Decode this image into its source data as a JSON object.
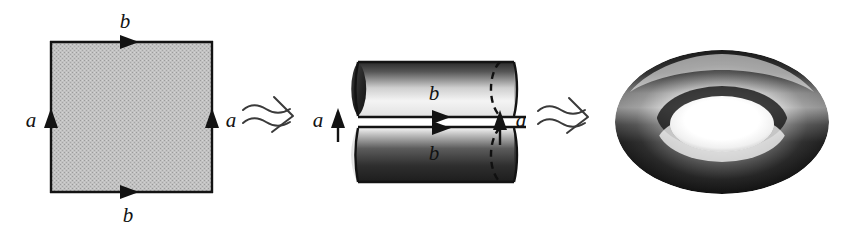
{
  "figure": {
    "background_color": "#ffffff",
    "ink_color": "#131313",
    "square_fill_color": "#b8b8b8",
    "stages": [
      {
        "id": "square",
        "name": "square",
        "caption": "Square with identified edges",
        "edge_labels": {
          "top": "b",
          "bottom": "b",
          "left": "a",
          "right": "a"
        },
        "edge_directions": {
          "top": "right",
          "bottom": "right",
          "left": "up",
          "right": "up"
        }
      },
      {
        "id": "cylinder",
        "name": "cylinder",
        "caption": "Cylinder formed by gluing the a edges",
        "edge_labels": {
          "top": "b",
          "bottom": "b",
          "seam": "a"
        },
        "edge_directions": {
          "top": "right",
          "bottom": "right",
          "seam": "up"
        }
      },
      {
        "id": "torus",
        "name": "torus",
        "caption": "Torus formed by gluing the b edges",
        "edge_labels": {},
        "edge_directions": {}
      }
    ],
    "transitions": [
      {
        "id": "arrow-1",
        "symbol": "squiggly-arrow",
        "from": "square",
        "to": "cylinder"
      },
      {
        "id": "arrow-2",
        "symbol": "squiggly-arrow",
        "from": "cylinder",
        "to": "torus"
      }
    ],
    "labels": {
      "a": "a",
      "b": "b"
    }
  }
}
